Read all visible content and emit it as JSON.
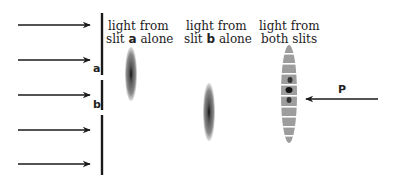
{
  "diagram": {
    "type": "double-slit interference illustration",
    "colors": {
      "ink": "#1a1a1a",
      "pattern": "#555555",
      "background": "#ffffff"
    },
    "incident_arrows": {
      "count": 5,
      "direction": "right"
    },
    "slits": [
      {
        "label": "a"
      },
      {
        "label": "b"
      }
    ],
    "captions": {
      "slit_a": {
        "line1": "light from",
        "line2_pre": "slit ",
        "line2_bold": "a",
        "line2_post": " alone"
      },
      "slit_b": {
        "line1": "light from",
        "line2_pre": "slit ",
        "line2_bold": "b",
        "line2_post": " alone"
      },
      "both": {
        "line1": "light from",
        "line2": "both slits"
      }
    },
    "pointer": {
      "label": "P",
      "direction": "left"
    },
    "fringe_bands": 9
  }
}
